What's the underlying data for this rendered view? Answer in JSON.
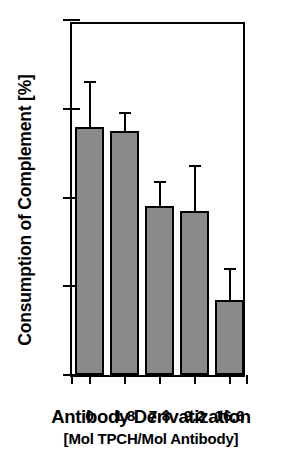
{
  "chart_data": {
    "type": "bar",
    "title": "",
    "xlabel": "Antibody Derivatization",
    "xsublabel": "[Mol TPCH/Mol Antibody]",
    "ylabel": "Consumption of Complement [%]",
    "categories": [
      "0",
      "1.8",
      "7.8",
      "9.2",
      "16.6"
    ],
    "values": [
      56,
      55,
      38,
      37,
      17
    ],
    "errors": [
      10,
      4,
      5.5,
      10,
      7
    ],
    "error_type": "upper-only",
    "ylim": [
      0,
      80
    ],
    "yticks": [
      0,
      20,
      40,
      60,
      80
    ],
    "ytick_labels": [
      "0",
      "20",
      "40",
      "60",
      "80"
    ],
    "grid": false,
    "legend": null,
    "bar_fill_color": "#8a8a8a",
    "bar_edge_color": "#000000",
    "axis_color": "#000000",
    "background_color": "#ffffff"
  }
}
